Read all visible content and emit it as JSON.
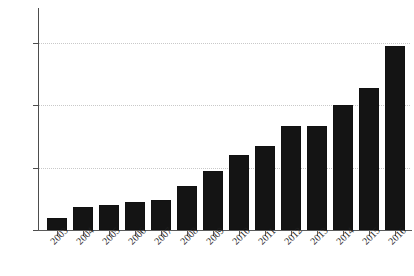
{
  "chart_data": {
    "type": "bar",
    "title": "",
    "xlabel": "",
    "ylabel": "",
    "categories": [
      "2003",
      "2004",
      "2005",
      "2006",
      "2007",
      "2008",
      "2009",
      "2010",
      "2011",
      "2012",
      "2013",
      "2014",
      "2015",
      "2016"
    ],
    "values": [
      48,
      55,
      56,
      58,
      59,
      68,
      78,
      88,
      94,
      107,
      107,
      120,
      131,
      158
    ],
    "ylim": [
      40,
      170
    ],
    "yticks": [
      40,
      80,
      120,
      160
    ],
    "ytick_labels": [
      "40",
      "80",
      "120",
      "160"
    ],
    "grid": true,
    "grid_style": "dotted-horizontal",
    "legend": "none",
    "bar_color": "#141414",
    "axis_color": "#4d4d4d",
    "grid_color": "#c9c9c9",
    "background": "#ffffff",
    "xtick_rotation": -45
  },
  "figure": {
    "title_text": "",
    "width": 414,
    "height": 276
  }
}
